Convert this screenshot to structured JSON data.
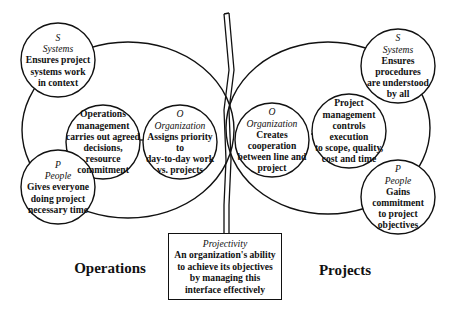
{
  "operations": {
    "title": "Operations",
    "systems": {
      "letter": "S",
      "name": "Systems",
      "lines": [
        "Ensures project",
        "systems work",
        "in context"
      ]
    },
    "management": {
      "lines": [
        "Operations",
        "management",
        "carries out agreed",
        "decisions, resource",
        "commitment"
      ]
    },
    "organization": {
      "letter": "O",
      "name": "Organization",
      "lines": [
        "Assigns priority to",
        "day-to-day work",
        "vs. projects"
      ]
    },
    "people": {
      "letter": "P",
      "name": "People",
      "lines": [
        "Gives everyone",
        "doing project",
        "necessary time"
      ]
    }
  },
  "projects": {
    "title": "Projects",
    "systems": {
      "letter": "S",
      "name": "Systems",
      "lines": [
        "Ensures procedures",
        "are understood",
        "by all"
      ]
    },
    "management": {
      "lines": [
        "Project",
        "management",
        "controls execution",
        "to scope, quality,",
        "cost and time"
      ]
    },
    "organization": {
      "letter": "O",
      "name": "Organization",
      "lines": [
        "Creates",
        "cooperation",
        "between line and",
        "project"
      ]
    },
    "people": {
      "letter": "P",
      "name": "People",
      "lines": [
        "Gains",
        "commitment",
        "to project",
        "objectives"
      ]
    }
  },
  "projectivity": {
    "title": "Projectivity",
    "lines": [
      "An organization's ability",
      "to achieve its objectives",
      "by managing this",
      "interface effectively"
    ]
  },
  "colors": {
    "stroke": "#111111",
    "background": "#ffffff"
  }
}
